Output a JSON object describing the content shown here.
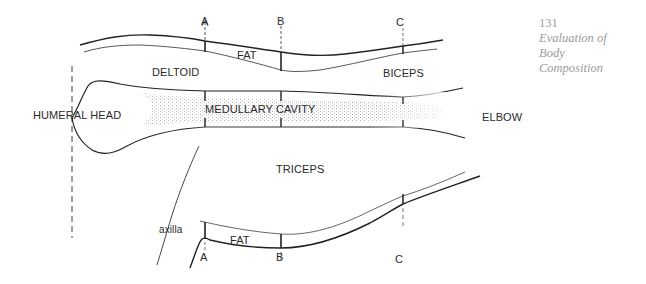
{
  "figure": {
    "section_markers": {
      "top": [
        "A",
        "B",
        "C"
      ],
      "bottom": [
        "A",
        "B",
        "C"
      ]
    },
    "labels": {
      "fat_top": "FAT",
      "fat_bottom": "FAT",
      "deltoid": "DELTOID",
      "biceps": "BICEPS",
      "humeral_head": "HUMERAL HEAD",
      "medullary_cavity": "MEDULLARY CAVITY",
      "elbow": "ELBOW",
      "triceps": "TRICEPS",
      "axilla": "axilla"
    },
    "colors": {
      "ink": "#2a2a2a",
      "shading": "#bdbdbd",
      "margin_text": "#9a9a9a"
    }
  },
  "margin": {
    "page_number": "131",
    "running_title_lines": [
      "Evaluation of",
      "Body",
      "Composition"
    ]
  }
}
